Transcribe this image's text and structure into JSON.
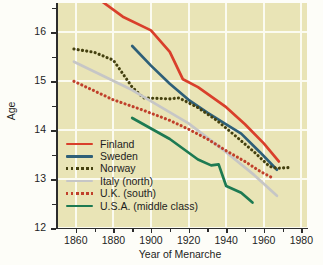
{
  "chart_data": {
    "type": "line",
    "title": "",
    "xlabel": "Year of Menarche",
    "ylabel": "Age",
    "xlim": [
      1850,
      1983
    ],
    "ylim": [
      12,
      16.6
    ],
    "xticks": [
      1860,
      1880,
      1900,
      1920,
      1940,
      1960,
      1980
    ],
    "xticks_minor": [
      1870,
      1890,
      1910,
      1930,
      1950,
      1970
    ],
    "yticks": [
      12,
      13,
      14,
      15,
      16
    ],
    "yticks_minor": [
      12.5,
      13.5,
      14.5,
      15.5,
      16.5
    ],
    "grid": true,
    "legend_position": "lower-left",
    "background": "#e9e4b6",
    "gridline_color": "#fbfbf0",
    "series": [
      {
        "name": "Finland",
        "color": "#d93f2b",
        "style": "solid",
        "points": [
          [
            1874,
            16.63
          ],
          [
            1885,
            16.32
          ],
          [
            1900,
            16.04
          ],
          [
            1910,
            15.6
          ],
          [
            1917,
            15.04
          ],
          [
            1925,
            14.88
          ],
          [
            1940,
            14.47
          ],
          [
            1950,
            14.12
          ],
          [
            1960,
            13.73
          ],
          [
            1968,
            13.36
          ]
        ]
      },
      {
        "name": "Sweden",
        "color": "#2e5f78",
        "style": "solid",
        "points": [
          [
            1890,
            15.72
          ],
          [
            1900,
            15.32
          ],
          [
            1910,
            14.95
          ],
          [
            1920,
            14.62
          ],
          [
            1930,
            14.36
          ],
          [
            1940,
            14.12
          ],
          [
            1948,
            13.93
          ],
          [
            1958,
            13.55
          ],
          [
            1967,
            13.19
          ]
        ]
      },
      {
        "name": "Norway",
        "color": "#44400f",
        "style": "dotted",
        "points": [
          [
            1859,
            15.66
          ],
          [
            1870,
            15.59
          ],
          [
            1880,
            15.43
          ],
          [
            1890,
            14.88
          ],
          [
            1896,
            14.66
          ],
          [
            1910,
            14.64
          ],
          [
            1915,
            14.66
          ],
          [
            1925,
            14.46
          ],
          [
            1935,
            14.2
          ],
          [
            1945,
            13.88
          ],
          [
            1955,
            13.55
          ],
          [
            1963,
            13.26
          ],
          [
            1967,
            13.22
          ],
          [
            1975,
            13.24
          ]
        ]
      },
      {
        "name": "Italy (north)",
        "color": "#c6c6c6",
        "style": "solid",
        "points": [
          [
            1859,
            15.4
          ],
          [
            1890,
            14.82
          ],
          [
            1920,
            14.14
          ],
          [
            1940,
            13.55
          ],
          [
            1955,
            13.08
          ],
          [
            1967,
            12.66
          ]
        ]
      },
      {
        "name": "U.K. (south)",
        "color": "#c0402b",
        "style": "dotted",
        "points": [
          [
            1859,
            15.0
          ],
          [
            1880,
            14.62
          ],
          [
            1895,
            14.42
          ],
          [
            1910,
            14.2
          ],
          [
            1920,
            14.02
          ],
          [
            1930,
            13.82
          ],
          [
            1940,
            13.58
          ],
          [
            1950,
            13.36
          ],
          [
            1958,
            13.16
          ],
          [
            1965,
            13.02
          ]
        ]
      },
      {
        "name": "U.S.A. (middle class)",
        "color": "#1d7a52",
        "style": "solid",
        "points": [
          [
            1890,
            14.25
          ],
          [
            1910,
            13.82
          ],
          [
            1925,
            13.4
          ],
          [
            1932,
            13.28
          ],
          [
            1936,
            13.3
          ],
          [
            1940,
            12.86
          ],
          [
            1948,
            12.72
          ],
          [
            1954,
            12.52
          ]
        ]
      }
    ]
  },
  "legend": {
    "items": [
      {
        "label": "Finland",
        "color": "#d93f2b",
        "style": "solid"
      },
      {
        "label": "Sweden",
        "color": "#2e5f78",
        "style": "solid"
      },
      {
        "label": "Norway",
        "color": "#44400f",
        "style": "dotted"
      },
      {
        "label": "Italy (north)",
        "color": "#c6c6c6",
        "style": "solid"
      },
      {
        "label": "U.K. (south)",
        "color": "#c0402b",
        "style": "dotted"
      },
      {
        "label": "U.S.A. (middle class)",
        "color": "#1d7a52",
        "style": "solid"
      }
    ]
  },
  "axes": {
    "y_title": "Age",
    "x_title": "Year of Menarche",
    "y_tick_labels": [
      "12",
      "13",
      "14",
      "15",
      "16"
    ],
    "x_tick_labels": [
      "1860",
      "1880",
      "1900",
      "1920",
      "1940",
      "1960",
      "1980"
    ]
  }
}
